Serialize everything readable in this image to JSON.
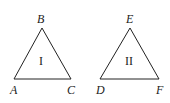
{
  "diagram": {
    "triangles": [
      {
        "id": "I",
        "label": "I",
        "vertices": {
          "top": "B",
          "left": "A",
          "right": "C"
        }
      },
      {
        "id": "II",
        "label": "II",
        "vertices": {
          "top": "E",
          "left": "D",
          "right": "F"
        }
      }
    ],
    "stroke_color": "#222222"
  }
}
